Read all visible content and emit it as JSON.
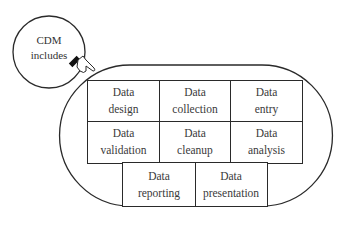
{
  "diagram": {
    "bubble": {
      "line1": "CDM",
      "line2": "includes"
    },
    "pointer_icon": "pointing-hand-icon",
    "cells": [
      {
        "id": "data-design",
        "line1": "Data",
        "line2": "design"
      },
      {
        "id": "data-collection",
        "line1": "Data",
        "line2": "collection"
      },
      {
        "id": "data-entry",
        "line1": "Data",
        "line2": "entry"
      },
      {
        "id": "data-validation",
        "line1": "Data",
        "line2": "validation"
      },
      {
        "id": "data-cleanup",
        "line1": "Data",
        "line2": "cleanup"
      },
      {
        "id": "data-analysis",
        "line1": "Data",
        "line2": "analysis"
      },
      {
        "id": "data-reporting",
        "line1": "Data",
        "line2": "reporting"
      },
      {
        "id": "data-presentation",
        "line1": "Data",
        "line2": "presentation"
      }
    ]
  }
}
